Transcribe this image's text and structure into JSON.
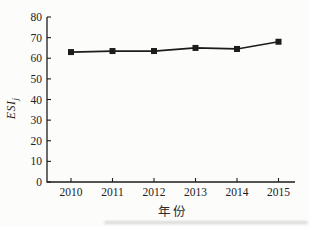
{
  "figure": {
    "background": "#fcfcfb",
    "ink_color": "#1c1c1c"
  },
  "chart_data": {
    "type": "line",
    "title": "",
    "xlabel": "年份",
    "ylabel_base": "ESI",
    "ylabel_subscript": "j",
    "x": [
      "2010",
      "2011",
      "2012",
      "2013",
      "2014",
      "2015"
    ],
    "series": [
      {
        "name": "ESI_j",
        "values": [
          63,
          63.5,
          63.5,
          65,
          64.5,
          68
        ],
        "marker": "square",
        "color": "#1c1c1c"
      }
    ],
    "ylim": [
      0,
      80
    ],
    "yticks": [
      0,
      10,
      20,
      30,
      40,
      50,
      60,
      70,
      80
    ],
    "grid": false,
    "legend": "none",
    "tick_direction": "in"
  }
}
